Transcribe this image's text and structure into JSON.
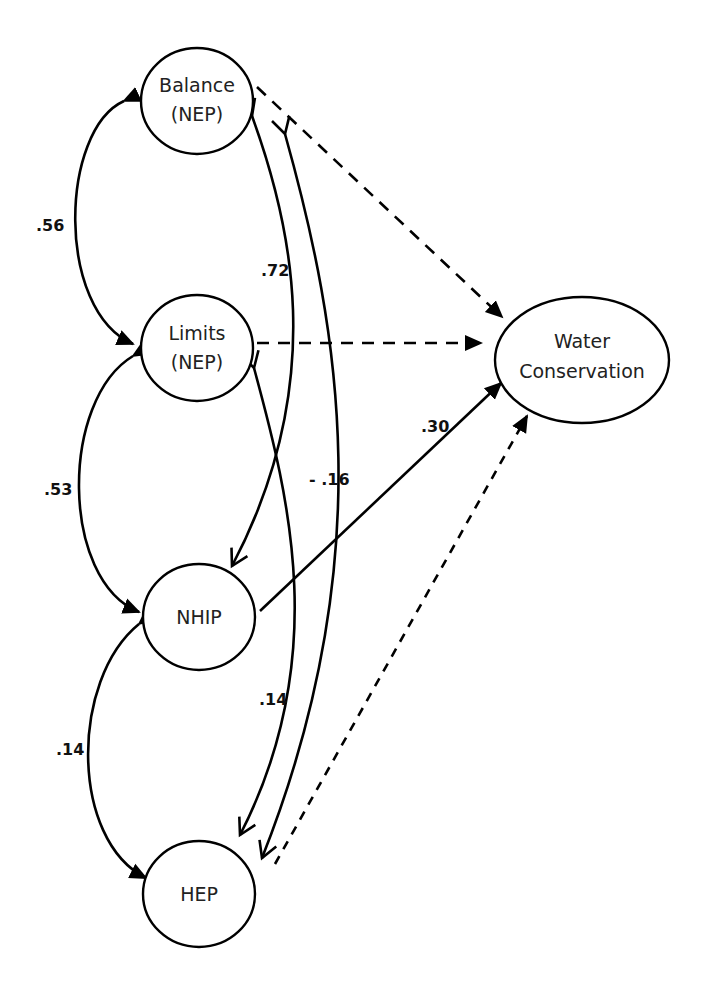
{
  "diagram": {
    "type": "path-model",
    "nodes": [
      {
        "id": "balance",
        "lines": [
          "Balance",
          "(NEP)"
        ],
        "shape": "circle"
      },
      {
        "id": "limits",
        "lines": [
          "Limits",
          "(NEP)"
        ],
        "shape": "circle"
      },
      {
        "id": "nhip",
        "lines": [
          "NHIP"
        ],
        "shape": "circle"
      },
      {
        "id": "hep",
        "lines": [
          "HEP"
        ],
        "shape": "circle"
      },
      {
        "id": "water",
        "lines": [
          "Water",
          "Conservation"
        ],
        "shape": "ellipse"
      }
    ],
    "covariances": [
      {
        "from": "balance",
        "to": "limits",
        "value": ".56"
      },
      {
        "from": "limits",
        "to": "nhip",
        "value": ".53"
      },
      {
        "from": "nhip",
        "to": "hep",
        "value": ".14"
      },
      {
        "from": "balance",
        "to": "nhip",
        "value": ".72"
      },
      {
        "from": "limits",
        "to": "hep",
        "value": ".14"
      },
      {
        "from": "balance",
        "to": "hep",
        "value": "- .16"
      }
    ],
    "paths": [
      {
        "from": "balance",
        "to": "water",
        "style": "dashed",
        "value": ""
      },
      {
        "from": "limits",
        "to": "water",
        "style": "dashed",
        "value": ""
      },
      {
        "from": "nhip",
        "to": "water",
        "style": "solid",
        "value": ".30"
      },
      {
        "from": "hep",
        "to": "water",
        "style": "dashed",
        "value": ""
      }
    ],
    "colors": {
      "stroke": "#000000",
      "background": "#ffffff",
      "text": "#222222"
    }
  }
}
